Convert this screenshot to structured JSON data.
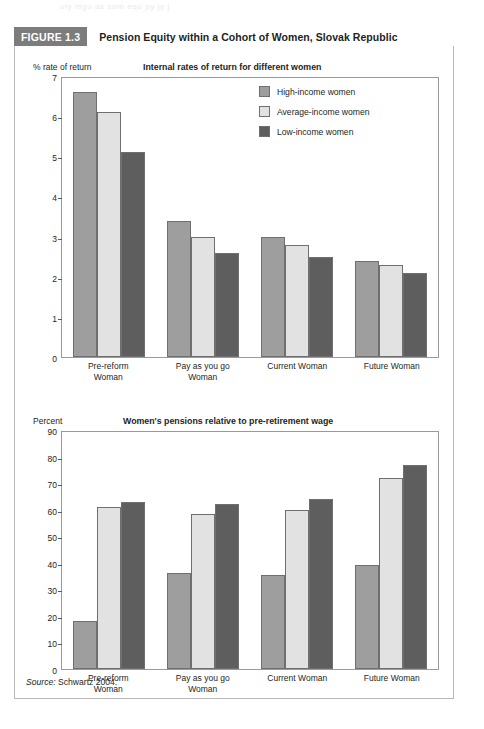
{
  "page": {
    "ghost_header_text": "uly mgu  as sum equ py jy j"
  },
  "figure": {
    "tag": "FIGURE 1.3",
    "title": "Pension Equity within a Cohort of Women, Slovak Republic",
    "source_word": "Source:",
    "source_text": " Schwartz 2004."
  },
  "legend": {
    "items": [
      {
        "label": "High-income women",
        "color": "#9e9e9e"
      },
      {
        "label": "Average-income women",
        "color": "#e2e2e2"
      },
      {
        "label": "Low-income women",
        "color": "#5e5e5e"
      }
    ]
  },
  "chart_data": [
    {
      "type": "bar",
      "id": "internal-rates-of-return",
      "title": "Internal rates of return for different women",
      "ylabel": "% rate of return",
      "xlabel": "",
      "ylim": [
        0,
        7
      ],
      "yticks": [
        0,
        1,
        2,
        3,
        4,
        5,
        6,
        7
      ],
      "ytick_labels": [
        "0",
        "1",
        "2",
        "3",
        "4",
        "5",
        "6",
        "7"
      ],
      "grid": false,
      "legend_position": "upper-right-inside",
      "categories": [
        "Pre-reform Woman",
        "Pay as you go Woman",
        "Current Woman",
        "Future Woman"
      ],
      "series": [
        {
          "name": "High-income women",
          "color": "#9e9e9e",
          "values": [
            6.6,
            3.4,
            3.0,
            2.4
          ]
        },
        {
          "name": "Average-income women",
          "color": "#e2e2e2",
          "values": [
            6.1,
            3.0,
            2.8,
            2.3
          ]
        },
        {
          "name": "Low-income women",
          "color": "#5e5e5e",
          "values": [
            5.1,
            2.6,
            2.5,
            2.1
          ]
        }
      ]
    },
    {
      "type": "bar",
      "id": "pensions-relative-to-wage",
      "title": "Women's pensions relative to pre-retirement wage",
      "ylabel": "Percent",
      "xlabel": "",
      "ylim": [
        0,
        90
      ],
      "yticks": [
        0,
        10,
        20,
        30,
        40,
        50,
        60,
        70,
        80,
        90
      ],
      "ytick_labels": [
        "0",
        "10",
        "20",
        "30",
        "40",
        "50",
        "60",
        "70",
        "80",
        "90"
      ],
      "grid": false,
      "legend_position": "none",
      "categories": [
        "Pre-reform Woman",
        "Pay as you go Woman",
        "Current Woman",
        "Future Woman"
      ],
      "series": [
        {
          "name": "High-income women",
          "color": "#9e9e9e",
          "values": [
            18,
            36,
            35.5,
            39
          ]
        },
        {
          "name": "Average-income women",
          "color": "#e2e2e2",
          "values": [
            61,
            58.5,
            60,
            72
          ]
        },
        {
          "name": "Low-income women",
          "color": "#5e5e5e",
          "values": [
            63,
            62,
            64,
            77
          ]
        }
      ]
    }
  ]
}
